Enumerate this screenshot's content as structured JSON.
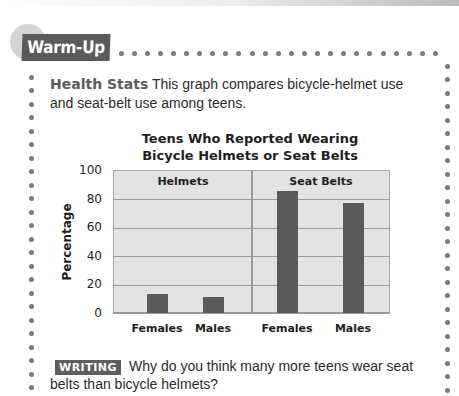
{
  "header": {
    "badge_label": "Warm-Up"
  },
  "intro": {
    "lead": "Health Stats",
    "text": "This graph compares bicycle-helmet use and seat-belt use among teens."
  },
  "chart": {
    "title_line1": "Teens Who Reported Wearing",
    "title_line2": "Bicycle Helmets or Seat Belts",
    "ylabel": "Percentage",
    "yticks": [
      "100",
      "80",
      "60",
      "40",
      "20",
      "0"
    ],
    "sections": [
      {
        "label": "Helmets",
        "x_labels": [
          "Females",
          "Males"
        ]
      },
      {
        "label": "Seat Belts",
        "x_labels": [
          "Females",
          "Males"
        ]
      }
    ],
    "bar_color": "#5a5a5a",
    "plot_bg": "#e3e3e3"
  },
  "chart_data": {
    "type": "bar",
    "title": "Teens Who Reported Wearing Bicycle Helmets or Seat Belts",
    "xlabel": "",
    "ylabel": "Percentage",
    "ylim": [
      0,
      100
    ],
    "yticks": [
      0,
      20,
      40,
      60,
      80,
      100
    ],
    "grid": true,
    "groups": [
      "Helmets",
      "Seat Belts"
    ],
    "categories": [
      "Females",
      "Males"
    ],
    "series": [
      {
        "name": "Helmets",
        "values": [
          13,
          11
        ]
      },
      {
        "name": "Seat Belts",
        "values": [
          85,
          77
        ]
      }
    ],
    "legend": "none (group labels inside plot panels)"
  },
  "writing": {
    "badge_label": "WRITING",
    "prompt": "Why do you think many more teens wear seat belts than bicycle helmets?"
  }
}
